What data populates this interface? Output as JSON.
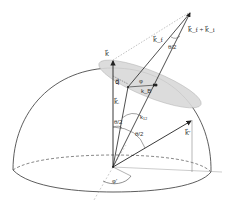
{
  "diagram": {
    "type": "vector geometry diagram (hemisphere with scattering vectors)",
    "labels": {
      "k_vertical": "k⃗",
      "q": "q⃗",
      "k_i": "k⃗ᵢ",
      "k_f": "k⃗_f",
      "k_sum": "k⃗_f + k⃗_i",
      "k_prime": "k⃗′",
      "k_B": "k_B",
      "k_12": "k₁₂",
      "phi_upper": "φ",
      "phi_lower": "φ′",
      "theta_half_top": "θ/2",
      "theta_half_left": "θ/2",
      "theta_half_right": "θ/2"
    },
    "colors": {
      "line": "#222222",
      "dashed": "#555555",
      "disk_fill": "#d9d9d9",
      "dotted_guide": "#999999"
    }
  }
}
